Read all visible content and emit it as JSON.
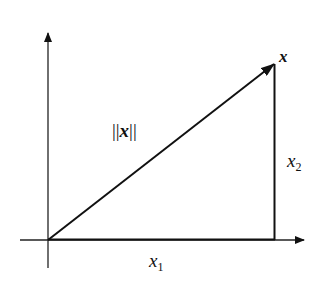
{
  "diagram": {
    "type": "vector-decomposition",
    "colors": {
      "line": "#111111",
      "background": "#ffffff"
    },
    "vector": {
      "name": "x",
      "label": "x",
      "norm_label_left": "||",
      "norm_label_var": "x",
      "norm_label_right": "||"
    },
    "components": {
      "horizontal": {
        "var": "x",
        "subscript": "1"
      },
      "vertical": {
        "var": "x",
        "subscript": "2"
      }
    },
    "axes": {
      "x_axis": "horizontal-arrow",
      "y_axis": "vertical-arrow"
    }
  }
}
